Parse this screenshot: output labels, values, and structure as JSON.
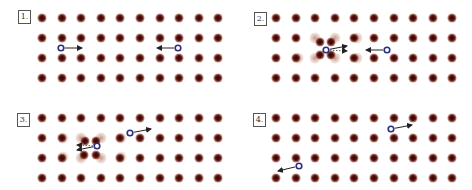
{
  "figure": {
    "colors": {
      "ion_core": "#4a0e0e",
      "ion_halo": "#9a4a3a",
      "ion_ghost": "#c9a08f",
      "electron": "#2a2f7c",
      "arrow": "#222222"
    },
    "lattice": {
      "columns": 10,
      "rows": 4,
      "spacing_x": 19.6,
      "spacing_y": 20
    },
    "panels": [
      {
        "label": "1.",
        "label_pos": [
          18,
          10
        ],
        "origin": [
          42,
          18
        ],
        "displaced_ions": [],
        "electrons": [
          {
            "x": 61,
            "y": 48,
            "arrow_to": [
              82,
              48
            ],
            "dotted": false
          },
          {
            "x": 178,
            "y": 48,
            "arrow_to": [
              157,
              48
            ],
            "dotted": false
          }
        ]
      },
      {
        "label": "2.",
        "label_pos": [
          254,
          12
        ],
        "origin": [
          276,
          18
        ],
        "displaced_ions": [
          {
            "from": [
              315,
              38
            ],
            "to": [
              320,
              42
            ]
          },
          {
            "from": [
              335,
              38
            ],
            "to": [
              331,
              42
            ]
          },
          {
            "from": [
              315,
              58
            ],
            "to": [
              320,
              55
            ]
          },
          {
            "from": [
              335,
              58
            ],
            "to": [
              331,
              55
            ]
          }
        ],
        "ghost_ions": [
          [
            296,
            58
          ],
          [
            355,
            38
          ],
          [
            355,
            58
          ]
        ],
        "electrons": [
          {
            "x": 326,
            "y": 50,
            "arrow_to": [
              347,
              46
            ],
            "dotted": false,
            "extra_dotted_to": [
              347,
              51
            ]
          },
          {
            "x": 387,
            "y": 50,
            "arrow_to": [
              366,
              50
            ],
            "dotted": false
          }
        ]
      },
      {
        "label": "3.",
        "label_pos": [
          17,
          113
        ],
        "origin": [
          42,
          118
        ],
        "displaced_ions": [
          {
            "from": [
              80,
              138
            ],
            "to": [
              85,
              141
            ]
          },
          {
            "from": [
              100,
              138
            ],
            "to": [
              96,
              141
            ]
          },
          {
            "from": [
              80,
              157
            ],
            "to": [
              84,
              155
            ]
          },
          {
            "from": [
              100,
              157
            ],
            "to": [
              96,
              155
            ]
          }
        ],
        "ghost_ions": [
          [
            61,
            138
          ],
          [
            61,
            157
          ],
          [
            119,
            138
          ],
          [
            119,
            157
          ]
        ],
        "electrons": [
          {
            "x": 97,
            "y": 146,
            "arrow_to": [
              77,
              150
            ],
            "dotted": false,
            "extra_dotted_to": [
              77,
              145
            ]
          },
          {
            "x": 130,
            "y": 133,
            "arrow_to": [
              151,
              129
            ],
            "dotted": false
          }
        ]
      },
      {
        "label": "4.",
        "label_pos": [
          253,
          113
        ],
        "origin": [
          276,
          118
        ],
        "displaced_ions": [],
        "electrons": [
          {
            "x": 391,
            "y": 129,
            "arrow_to": [
              412,
              125
            ],
            "dotted": false
          },
          {
            "x": 299,
            "y": 166,
            "arrow_to": [
              278,
              171
            ],
            "dotted": false
          }
        ]
      }
    ]
  }
}
